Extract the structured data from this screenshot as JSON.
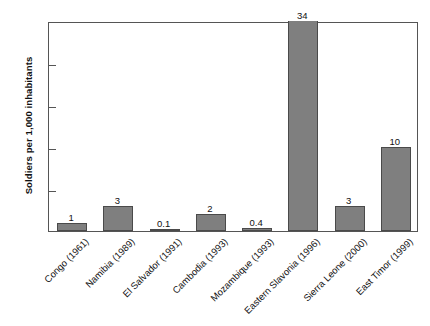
{
  "chart_data": {
    "type": "bar",
    "title": "",
    "xlabel": "",
    "ylabel": "Soldiers per 1,000 inhabitants",
    "ylim": [
      0,
      25
    ],
    "yticks": [
      0,
      5,
      10,
      15,
      20,
      25
    ],
    "grid": false,
    "legend": null,
    "note": "The Eastern Slavonia (1996) bar has value 34, which exceeds the y-axis maximum of 25, so the bar is clipped at the top of the plot frame.",
    "categories": [
      "Congo (1961)",
      "Namibia (1989)",
      "El Salvador (1991)",
      "Cambodia (1993)",
      "Mozambique (1993)",
      "Eastern Slavonia (1996)",
      "Sierra Leone (2000)",
      "East Timor (1999)"
    ],
    "values": [
      1,
      3,
      0.1,
      2,
      0.4,
      34,
      3,
      10
    ],
    "value_labels": [
      "1",
      "3",
      "0.1",
      "2",
      "0.4",
      "34",
      "3",
      "10"
    ],
    "bar_color": "#7f7f7f",
    "bar_edge_color": "#4a4a4a",
    "axis_color": "#555555"
  },
  "caption": {
    "text": ""
  }
}
